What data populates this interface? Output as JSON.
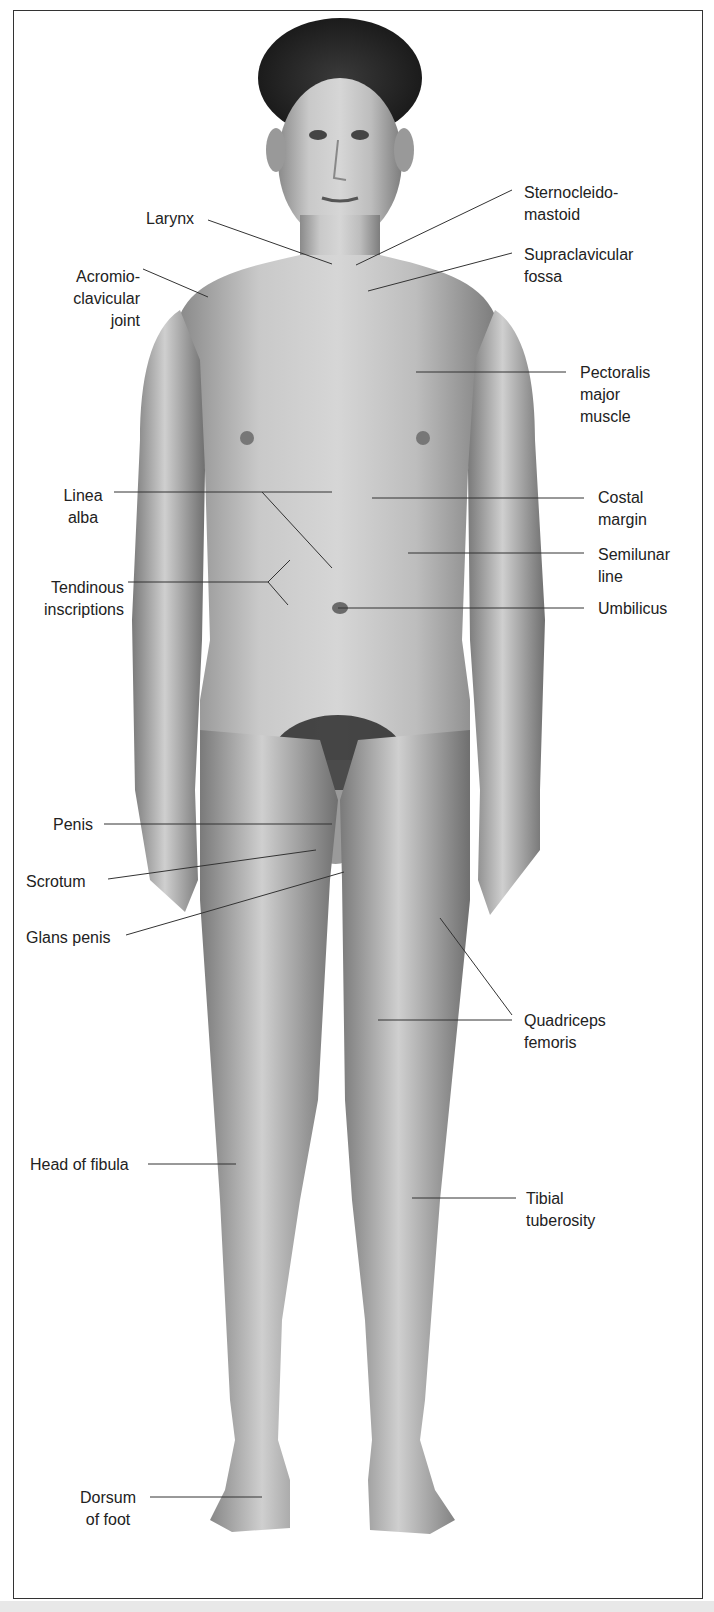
{
  "figure": {
    "labels": {
      "larynx": "Larynx",
      "sternocleidomastoid": "Sternocleido-\nmastoid",
      "supraclavicular_fossa": "Supraclavicular\nfossa",
      "acromioclavicular_joint": "Acromio-\nclavicular\njoint",
      "pectoralis_major": "Pectoralis\nmajor\nmuscle",
      "linea_alba": "Linea\nalba",
      "costal_margin": "Costal\nmargin",
      "semilunar_line": "Semilunar\nline",
      "tendinous_inscriptions": "Tendinous\ninscriptions",
      "umbilicus": "Umbilicus",
      "penis": "Penis",
      "scrotum": "Scrotum",
      "glans_penis": "Glans penis",
      "quadriceps_femoris": "Quadriceps\nfemoris",
      "head_of_fibula": "Head of fibula",
      "tibial_tuberosity": "Tibial\ntuberosity",
      "dorsum_of_foot": "Dorsum\nof foot"
    }
  }
}
